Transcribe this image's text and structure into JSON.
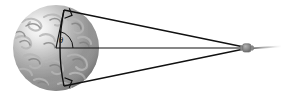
{
  "figure": {
    "background_color": "#ffffff",
    "line_color": "#111111",
    "width": 283,
    "height": 96
  },
  "earth": {
    "name": "Earth",
    "center_x": 56,
    "center_y": 48,
    "radius": 43,
    "fill_base": "#9d9d9d",
    "highlight_color": "#f2f2f2",
    "shadow_color": "#6a6a6a",
    "continent_color": "#b9b9b9",
    "ocean_color": "#8a8a8a"
  },
  "satellite": {
    "name": "satellite",
    "x": 246,
    "y": 48,
    "width": 11,
    "height": 9,
    "fill": "#8c8c8c",
    "stroke": "#6f6f6f"
  },
  "axis_line": {
    "name": "center-axis",
    "x1": 56,
    "y1": 48,
    "x2": 246,
    "y2": 48
  },
  "trailing_line": {
    "name": "orbit-trail",
    "x1": 252,
    "y1": 48,
    "x2": 281,
    "y2": 46
  },
  "tangent_upper": {
    "name": "upper-tangent",
    "x1": 64,
    "y1": 10,
    "x2": 244,
    "y2": 47
  },
  "tangent_lower": {
    "name": "lower-tangent",
    "x1": 64,
    "y1": 86,
    "x2": 244,
    "y2": 49
  },
  "chord": {
    "name": "visibility-chord",
    "x1": 64,
    "y1": 10,
    "x2": 64,
    "y2": 86,
    "bulge_x": 56,
    "bulge_y": 48
  },
  "right_angle_markers": [
    {
      "name": "right-angle-upper",
      "x": 64,
      "y": 10,
      "size": 8
    },
    {
      "name": "right-angle-lower",
      "x": 64,
      "y": 86,
      "size": 8
    }
  ],
  "angle": {
    "name": "central-angle",
    "label": "θ",
    "label_x": 61,
    "label_y": 42,
    "vertex_x": 56,
    "vertex_y": 48,
    "arc_radius": 17
  }
}
